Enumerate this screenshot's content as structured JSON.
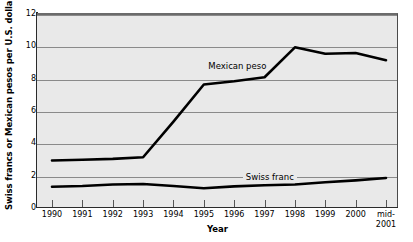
{
  "chart_data": {
    "type": "line",
    "title": "",
    "xlabel": "Year",
    "ylabel": "Swiss francs or Mexican pesos per U.S. dollar",
    "categories": [
      "1990",
      "1991",
      "1992",
      "1993",
      "1994",
      "1995",
      "1996",
      "1997",
      "1998",
      "1999",
      "2000",
      "mid-\n2001"
    ],
    "xtick_labels": [
      "1990",
      "1991",
      "1992",
      "1993",
      "1994",
      "1995",
      "1996",
      "1997",
      "1998",
      "1999",
      "2000",
      "mid-\n2001"
    ],
    "ylim": [
      0,
      12
    ],
    "yticks": [
      0,
      2,
      4,
      6,
      8,
      10,
      12
    ],
    "ytick_labels": [
      "0",
      "2",
      "4",
      "6",
      "8",
      "10",
      "12"
    ],
    "grid": true,
    "legend_position": "inline-annotations",
    "series": [
      {
        "name": "Mexican peso",
        "values": [
          3.0,
          3.05,
          3.1,
          3.2,
          5.4,
          7.7,
          7.9,
          8.15,
          10.0,
          9.6,
          9.65,
          9.2
        ],
        "color": "#000000"
      },
      {
        "name": "Swiss franc",
        "values": [
          1.38,
          1.42,
          1.52,
          1.55,
          1.42,
          1.28,
          1.4,
          1.47,
          1.52,
          1.65,
          1.77,
          1.92
        ],
        "color": "#000000"
      }
    ],
    "annotations": [
      {
        "text": "Mexican peso",
        "x_frac": 0.555,
        "y_value": 8.85,
        "boxed": false
      },
      {
        "text": "Swiss franc",
        "x_frac": 0.645,
        "y_value": 2.0,
        "boxed": true
      }
    ]
  },
  "colors": {
    "plot_background": "#e9e9e9",
    "gridline": "#8a8a8a",
    "axis": "#2b2b2b",
    "line": "#000000",
    "page_background": "#ffffff"
  }
}
